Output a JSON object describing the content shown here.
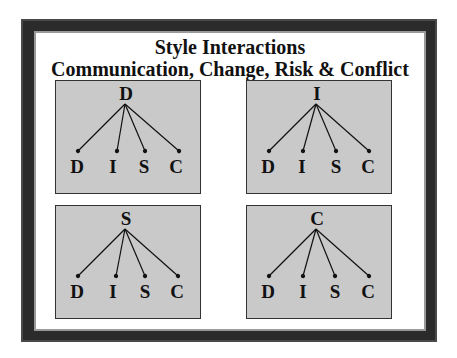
{
  "slide": {
    "title": "Style Interactions",
    "subtitle": "Communication, Change, Risk & Conflict"
  },
  "colors": {
    "frame": "#2b2b2b",
    "box_fill": "#c9c9c9",
    "text": "#111111"
  },
  "diagrams": [
    {
      "root": "D",
      "children": [
        "D",
        "I",
        "S",
        "C"
      ]
    },
    {
      "root": "I",
      "children": [
        "D",
        "I",
        "S",
        "C"
      ]
    },
    {
      "root": "S",
      "children": [
        "D",
        "I",
        "S",
        "C"
      ]
    },
    {
      "root": "C",
      "children": [
        "D",
        "I",
        "S",
        "C"
      ]
    }
  ]
}
